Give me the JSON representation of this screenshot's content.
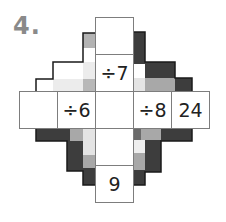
{
  "puzzle": {
    "number_label": "4.",
    "colors": {
      "dark": "#3d3d3d",
      "medium": "#a8a8a8",
      "light": "#e4e4e4",
      "lighter": "#efefef",
      "outline": "#1a1a1a",
      "label": "#8a8a8a"
    },
    "cells": {
      "top_1": "",
      "top_2": "÷7",
      "left_1": "",
      "left_2": "÷6",
      "center": "",
      "right_1": "÷8",
      "right_2": "24",
      "bottom_1": "",
      "bottom_2": "9"
    }
  }
}
